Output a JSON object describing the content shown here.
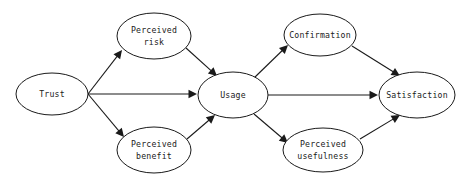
{
  "diagram": {
    "type": "directed-graph",
    "background_color": "#ffffff",
    "stroke_color": "#1a1a1a",
    "node_fill_color": "#ffffff",
    "nodes": [
      {
        "id": "trust",
        "label": "Trust",
        "line1": "Trust",
        "line2": "",
        "cx": 52,
        "cy": 94,
        "rx": 36,
        "ry": 21
      },
      {
        "id": "perceived_risk",
        "label": "Perceived risk",
        "line1": "Perceived",
        "line2": "risk",
        "cx": 154,
        "cy": 36,
        "rx": 37,
        "ry": 23
      },
      {
        "id": "perceived_benefit",
        "label": "Perceived benefit",
        "line1": "Perceived",
        "line2": "benefit",
        "cx": 154,
        "cy": 150,
        "rx": 37,
        "ry": 23
      },
      {
        "id": "usage",
        "label": "Usage",
        "line1": "Usage",
        "line2": "",
        "cx": 233,
        "cy": 95,
        "rx": 35,
        "ry": 23
      },
      {
        "id": "confirmation",
        "label": "Confirmation",
        "line1": "Confirmation",
        "line2": "",
        "cx": 320,
        "cy": 35,
        "rx": 36,
        "ry": 21
      },
      {
        "id": "perceived_usefulness",
        "label": "Perceived usefulness",
        "line1": "Perceived",
        "line2": "usefulness",
        "cx": 323,
        "cy": 150,
        "rx": 40,
        "ry": 22
      },
      {
        "id": "satisfaction",
        "label": "Satisfaction",
        "line1": "Satisfaction",
        "line2": "",
        "cx": 417,
        "cy": 95,
        "rx": 38,
        "ry": 23
      }
    ],
    "edges": [
      {
        "id": "e1",
        "from": "trust",
        "to": "perceived_risk",
        "x1": 88,
        "y1": 94,
        "x2": 122,
        "y2": 50
      },
      {
        "id": "e2",
        "from": "trust",
        "to": "usage",
        "x1": 88,
        "y1": 94,
        "x2": 197,
        "y2": 94
      },
      {
        "id": "e3",
        "from": "trust",
        "to": "perceived_benefit",
        "x1": 88,
        "y1": 94,
        "x2": 124,
        "y2": 137
      },
      {
        "id": "e4",
        "from": "perceived_risk",
        "to": "usage",
        "x1": 186,
        "y1": 48,
        "x2": 217,
        "y2": 76
      },
      {
        "id": "e5",
        "from": "perceived_benefit",
        "to": "usage",
        "x1": 187,
        "y1": 139,
        "x2": 215,
        "y2": 115
      },
      {
        "id": "e6",
        "from": "usage",
        "to": "confirmation",
        "x1": 254,
        "y1": 78,
        "x2": 288,
        "y2": 45
      },
      {
        "id": "e7",
        "from": "usage",
        "to": "satisfaction",
        "x1": 268,
        "y1": 95,
        "x2": 378,
        "y2": 95
      },
      {
        "id": "e8",
        "from": "usage",
        "to": "perceived_usefulness",
        "x1": 254,
        "y1": 114,
        "x2": 288,
        "y2": 143
      },
      {
        "id": "e9",
        "from": "confirmation",
        "to": "satisfaction",
        "x1": 352,
        "y1": 46,
        "x2": 400,
        "y2": 76
      },
      {
        "id": "e10",
        "from": "perceived_usefulness",
        "to": "satisfaction",
        "x1": 360,
        "y1": 139,
        "x2": 400,
        "y2": 115
      }
    ]
  }
}
